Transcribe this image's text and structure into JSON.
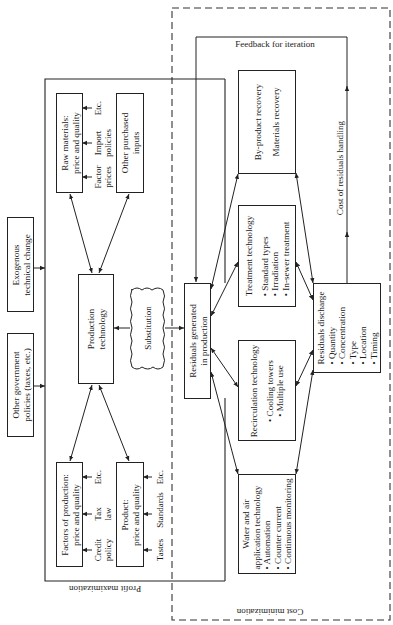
{
  "diagram": {
    "regions": {
      "profit_maximization": "Profit maximization",
      "cost_minimization": "Cost minimization"
    },
    "external": {
      "exogenous": [
        "Exogenous",
        "technical change"
      ],
      "other_government": [
        "Other government",
        "policies (taxes, etc.)"
      ]
    },
    "inputs": {
      "raw_materials": [
        "Raw materials:",
        "price and quality"
      ],
      "raw_materials_factors": [
        [
          "Factor",
          "prices"
        ],
        [
          "Import",
          "policies"
        ],
        [
          "Etc."
        ]
      ],
      "other_purchased": [
        "Other purchased",
        "inputs"
      ],
      "factors_of_production": [
        "Factors of production:",
        "price and quality"
      ],
      "factors_factors": [
        [
          "Credit",
          "policy"
        ],
        [
          "Tax",
          "law"
        ],
        [
          "Etc."
        ]
      ],
      "product": [
        "Product:",
        "price and quality"
      ],
      "product_factors": [
        [
          "Tastes"
        ],
        [
          "Standards"
        ],
        [
          "Etc."
        ]
      ]
    },
    "core": {
      "production_technology": [
        "Production",
        "technology"
      ],
      "substitution": "Substitution",
      "residuals_generated": [
        "Residuals generated",
        "in production"
      ]
    },
    "options": {
      "byproduct": {
        "title": "By-product recovery",
        "items": [
          "Materials recovery"
        ]
      },
      "treatment": {
        "title": "Treatment technology",
        "items": [
          "Standard types",
          "Irradiation",
          "In-sewer treatment"
        ]
      },
      "recirculation": {
        "title": "Recirculation technology",
        "items": [
          "Cooling towers",
          "Multiple use"
        ]
      },
      "water_air": {
        "title": [
          "Water and air",
          "application technology"
        ],
        "items": [
          "Automation",
          "Counter current",
          "Continuous monitoring"
        ]
      }
    },
    "discharge": {
      "title": "Residuals discharge",
      "items": [
        "Quantity",
        "Concentration",
        "Type",
        "Location",
        "Timing"
      ]
    },
    "feedback": {
      "label": "Feedback for iteration",
      "cost_label": "Cost of residuals handling"
    }
  }
}
